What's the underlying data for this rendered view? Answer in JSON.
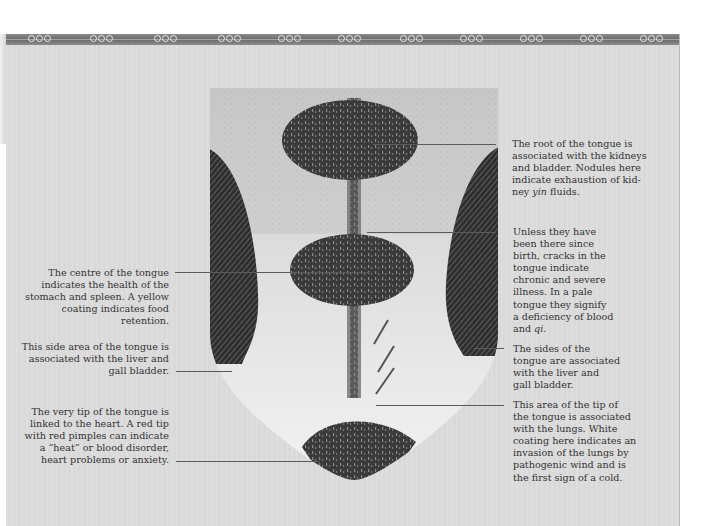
{
  "page": {
    "type": "illustrated-diagram"
  },
  "border": {
    "motif": "cloud-scroll-icon",
    "repeat_count": 11
  },
  "illustration": {
    "name": "tongue-diagram",
    "regions": [
      "root",
      "centre",
      "sides",
      "tip",
      "central-crack"
    ]
  },
  "annotations": {
    "root": {
      "side": "right",
      "lines": [
        "The root of the tongue is",
        "associated with the kidneys",
        "and bladder. Nodules here",
        "indicate exhaustion of kid-",
        "ney "
      ],
      "italic_word": "yin",
      "tail": " fluids."
    },
    "cracks": {
      "side": "right",
      "lines": [
        "Unless they have",
        "been there since",
        "birth, cracks in the",
        "tongue indicate",
        "chronic and severe",
        "illness. In a pale",
        "tongue they signify",
        "a deficiency of blood",
        "and "
      ],
      "italic_word": "qi",
      "tail": "."
    },
    "sides_right": {
      "side": "right",
      "lines": [
        "The sides of the",
        "tongue are associated",
        "with the liver and",
        "gall bladder."
      ]
    },
    "tip_right": {
      "side": "right",
      "lines": [
        "This area of the tip of",
        "the tongue is associated",
        "with the lungs. White",
        "coating here indicates an",
        "invasion of the lungs by",
        "pathogenic wind and is",
        "the first sign of a cold."
      ]
    },
    "centre": {
      "side": "left",
      "lines": [
        "The centre of the tongue",
        "indicates the health of the",
        "stomach and spleen. A yellow",
        "coating indicates food retention."
      ]
    },
    "side_left": {
      "side": "left",
      "lines": [
        "This side area of the tongue is",
        "associated with the liver and",
        "gall bladder."
      ]
    },
    "tip_left": {
      "side": "left",
      "lines": [
        "The very tip of the tongue is",
        "linked to the heart. A red tip",
        "with red pimples can indicate",
        "a “heat” or blood disorder,",
        "heart problems or anxiety."
      ]
    }
  },
  "colors": {
    "panel_bg": "#dcdcdc",
    "text": "#333333",
    "dark_region": "#3a3a3a",
    "tongue_light": "#eeeeee"
  }
}
